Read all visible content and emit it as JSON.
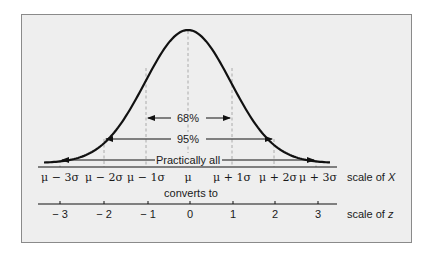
{
  "chart_data": {
    "type": "line",
    "title": "",
    "curve": "normal density",
    "intervals": [
      {
        "label": "68%",
        "from": "μ − 1σ",
        "to": "μ + 1σ",
        "from_z": -1,
        "to_z": 1
      },
      {
        "label": "95%",
        "from": "μ − 2σ",
        "to": "μ + 2σ",
        "from_z": -2,
        "to_z": 2
      },
      {
        "label": "Practically all",
        "from": "μ − 3σ",
        "to": "μ + 3σ",
        "from_z": -3,
        "to_z": 3
      }
    ],
    "x_scale": {
      "label": "scale of X",
      "ticks": [
        "μ − 3σ",
        "μ − 2σ",
        "μ − 1σ",
        "μ",
        "μ + 1σ",
        "μ + 2σ",
        "μ + 3σ"
      ]
    },
    "z_scale": {
      "label": "scale of z",
      "ticks": [
        "− 3",
        "− 2",
        "− 1",
        "0",
        "1",
        "2",
        "3"
      ],
      "values": [
        -3,
        -2,
        -1,
        0,
        1,
        2,
        3
      ]
    },
    "connector_text": "converts to",
    "legend": null,
    "grid": false
  },
  "labels": {
    "pct68": "68%",
    "pct95": "95%",
    "all": "Practically all",
    "converts": "converts to",
    "scaleX_prefix": "scale of ",
    "scaleX_var": "X",
    "scaleZ_prefix": "scale of ",
    "scaleZ_var": "z"
  },
  "x_ticks": [
    "μ − 3σ",
    "μ − 2σ",
    "μ − 1σ",
    "μ",
    "μ + 1σ",
    "μ + 2σ",
    "μ + 3σ"
  ],
  "z_ticks": [
    "− 3",
    "− 2",
    "− 1",
    "0",
    "1",
    "2",
    "3"
  ],
  "colors": {
    "panel_bg": "#eeeeee",
    "panel_border": "#8a8a8a",
    "curve": "#111111",
    "dashed": "#9a9a9a",
    "text": "#1a1a1a"
  }
}
